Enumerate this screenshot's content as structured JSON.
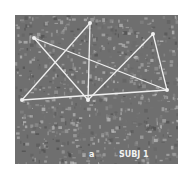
{
  "figure": {
    "panel_label": "a",
    "subject_label": "SUBJ 1",
    "background_color": "#6f6f6f",
    "line_color": "#f0f0f0",
    "nodes": [
      {
        "id": "n1",
        "x": 19,
        "y": 23
      },
      {
        "id": "n2",
        "x": 75,
        "y": 8
      },
      {
        "id": "n3",
        "x": 7,
        "y": 85
      },
      {
        "id": "n4",
        "x": 73,
        "y": 85
      },
      {
        "id": "n5",
        "x": 138,
        "y": 19
      },
      {
        "id": "n6",
        "x": 152,
        "y": 75
      }
    ],
    "edges": [
      [
        "n1",
        "n6"
      ],
      [
        "n1",
        "n4"
      ],
      [
        "n2",
        "n4"
      ],
      [
        "n2",
        "n3"
      ],
      [
        "n3",
        "n6"
      ],
      [
        "n4",
        "n5"
      ],
      [
        "n5",
        "n6"
      ]
    ]
  }
}
